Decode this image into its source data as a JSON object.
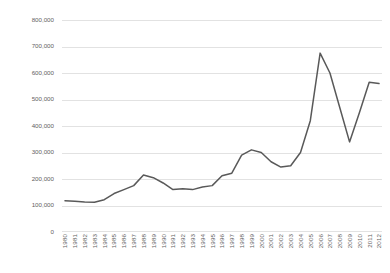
{
  "chart_data": {
    "type": "line",
    "title": "",
    "subtitle": "",
    "xlabel": "",
    "ylabel": "",
    "ylim": [
      0,
      800000
    ],
    "ytick_labels": [
      "800,000",
      "700,000",
      "600,000",
      "500,000",
      "400,000",
      "300,000",
      "200,000",
      "100,000",
      "0"
    ],
    "ytick_values": [
      800000,
      700000,
      600000,
      500000,
      400000,
      300000,
      200000,
      100000,
      0
    ],
    "grid": "horizontal",
    "legend": "none",
    "line_color": "#595959",
    "gridline_color": "#e2e2e2",
    "categories": [
      "1980",
      "1981",
      "1982",
      "1983",
      "1984",
      "1985",
      "1986",
      "1987",
      "1988",
      "1989",
      "1990",
      "1991",
      "1992",
      "1993",
      "1994",
      "1995",
      "1996",
      "1997",
      "1998",
      "1999",
      "2000",
      "2001",
      "2002",
      "2003",
      "2004",
      "2005",
      "2006",
      "2007",
      "2008",
      "2009",
      "2010",
      "2011",
      "2012"
    ],
    "series": [
      {
        "name": "",
        "values": [
          118000,
          116000,
          113000,
          112000,
          122000,
          145000,
          160000,
          175000,
          215000,
          205000,
          185000,
          160000,
          163000,
          160000,
          170000,
          175000,
          212000,
          222000,
          290000,
          310000,
          300000,
          265000,
          245000,
          250000,
          300000,
          420000,
          675000,
          600000,
          470000,
          340000,
          450000,
          565000,
          560000
        ]
      }
    ]
  }
}
